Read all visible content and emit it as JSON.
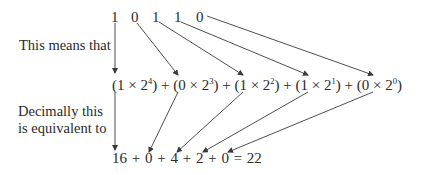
{
  "binary_digits": [
    "1",
    "0",
    "1",
    "1",
    "0"
  ],
  "labels": {
    "means": "This means that",
    "decimal_line1": "Decimally this",
    "decimal_line2": "is equivalent to"
  },
  "expansion": {
    "terms": [
      {
        "coef": "1",
        "base": "2",
        "exp": "4"
      },
      {
        "coef": "0",
        "base": "2",
        "exp": "3"
      },
      {
        "coef": "1",
        "base": "2",
        "exp": "2"
      },
      {
        "coef": "1",
        "base": "2",
        "exp": "1"
      },
      {
        "coef": "0",
        "base": "2",
        "exp": "0"
      }
    ],
    "operator": "+",
    "times": "×"
  },
  "decimal": {
    "values": [
      "16",
      "0",
      "4",
      "2",
      "0"
    ],
    "operator": "+",
    "equals": "=",
    "result": "22"
  },
  "colors": {
    "text": "#2a2a2a",
    "arrow": "#3a3a3a",
    "background": "#ffffff"
  }
}
